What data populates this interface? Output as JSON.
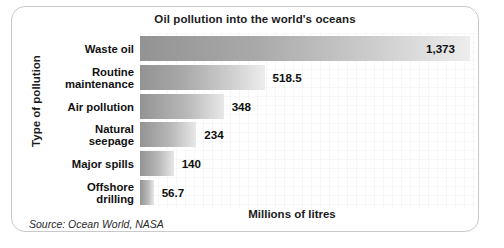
{
  "chart_data": {
    "type": "bar",
    "orientation": "horizontal",
    "title": "Oil pollution into the world's oceans",
    "xlabel": "Millions of litres",
    "ylabel": "Type of pollution",
    "categories": [
      "Waste oil",
      "Routine maintenance",
      "Air pollution",
      "Natural seepage",
      "Major spills",
      "Offshore drilling"
    ],
    "values": [
      1373,
      518.5,
      348,
      234,
      140,
      56.7
    ],
    "value_labels": [
      "1,373",
      "518.5",
      "348",
      "234",
      "140",
      "56.7"
    ],
    "xlim": [
      0,
      1373
    ],
    "grid": true,
    "legend": "none",
    "source": "Source: Ocean World, NASA",
    "bar_gradient_start": "#939393",
    "bar_gradient_end": "#ededed"
  },
  "rows": [
    {
      "label_line1": "Waste oil",
      "label_line2": "",
      "value_label": "1,373",
      "value": 1373,
      "label_inside": true
    },
    {
      "label_line1": "Routine",
      "label_line2": "maintenance",
      "value_label": "518.5",
      "value": 518.5,
      "label_inside": false
    },
    {
      "label_line1": "Air pollution",
      "label_line2": "",
      "value_label": "348",
      "value": 348,
      "label_inside": false
    },
    {
      "label_line1": "Natural",
      "label_line2": "seepage",
      "value_label": "234",
      "value": 234,
      "label_inside": false
    },
    {
      "label_line1": "Major spills",
      "label_line2": "",
      "value_label": "140",
      "value": 140,
      "label_inside": false
    },
    {
      "label_line1": "Offshore",
      "label_line2": "drilling",
      "value_label": "56.7",
      "value": 56.7,
      "label_inside": false
    }
  ]
}
